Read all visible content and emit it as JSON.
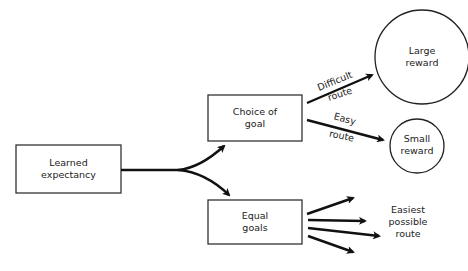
{
  "diagram": {
    "nodes": {
      "learned": {
        "line1": "Learned",
        "line2": "expectancy"
      },
      "choice": {
        "line1": "Choice of",
        "line2": "goal"
      },
      "equal": {
        "line1": "Equal",
        "line2": "goals"
      },
      "large_reward": {
        "line1": "Large",
        "line2": "reward"
      },
      "small_reward": {
        "line1": "Small",
        "line2": "reward"
      }
    },
    "edge_labels": {
      "difficult": {
        "line1": "Difficult",
        "line2": "route"
      },
      "easy": {
        "line1": "Easy",
        "line2": "route"
      },
      "easiest": {
        "line1": "Easiest",
        "line2": "possible",
        "line3": "route"
      }
    },
    "colors": {
      "stroke": "#111111",
      "text": "#222222",
      "background": "#ffffff"
    }
  }
}
